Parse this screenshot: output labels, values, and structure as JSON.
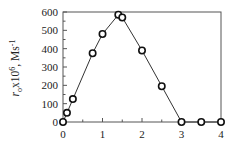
{
  "chart_data": {
    "type": "line",
    "title": "",
    "xlabel": "",
    "ylabel": "r_o x10^6, Ms^-1",
    "ylabel_parts": {
      "var": "r",
      "sub": "o",
      "mid": "x10",
      "sup": "6",
      "tail": ", Ms",
      "unit_sup": "-1"
    },
    "xlim": [
      0,
      4
    ],
    "ylim": [
      0,
      600
    ],
    "x_ticks": [
      0,
      1,
      2,
      3,
      4
    ],
    "x_minor_step": 0.5,
    "y_ticks": [
      0,
      100,
      200,
      300,
      400,
      500,
      600
    ],
    "y_minor_step": 50,
    "grid": false,
    "legend": null,
    "series": [
      {
        "name": "r_o",
        "marker": "open-circle",
        "line_color": "#333333",
        "x": [
          0,
          0.1,
          0.25,
          0.75,
          1.0,
          1.4,
          1.5,
          2.0,
          2.5,
          3.0,
          3.5,
          4.0
        ],
        "values": [
          0,
          50,
          125,
          375,
          480,
          585,
          570,
          390,
          195,
          0,
          0,
          0
        ]
      }
    ]
  }
}
